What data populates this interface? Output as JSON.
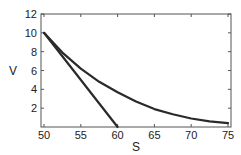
{
  "chart_data": {
    "type": "line",
    "title": "",
    "xlabel": "S",
    "ylabel": "V",
    "xlim": [
      50,
      75
    ],
    "ylim": [
      0,
      12
    ],
    "xticks": [
      50,
      55,
      60,
      65,
      70,
      75
    ],
    "yticks": [
      2,
      4,
      6,
      8,
      10,
      12
    ],
    "grid": false,
    "legend": null,
    "series": [
      {
        "name": "curve",
        "x": [
          50,
          52.5,
          55,
          57.5,
          60,
          62.5,
          65,
          67.5,
          70,
          72.5,
          75
        ],
        "y": [
          10,
          7.9,
          6.2,
          4.8,
          3.7,
          2.7,
          1.9,
          1.35,
          0.9,
          0.6,
          0.4
        ]
      },
      {
        "name": "line",
        "x": [
          50,
          60
        ],
        "y": [
          10,
          0
        ]
      }
    ]
  },
  "colors": {
    "line": "#2a2a2a",
    "frame": "#555555",
    "text": "#222222"
  }
}
